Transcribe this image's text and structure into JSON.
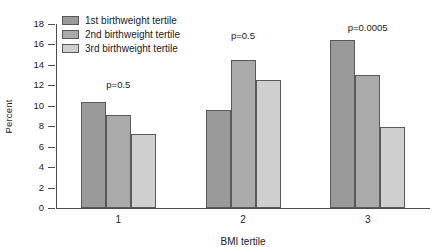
{
  "chart_data": {
    "type": "bar",
    "title": "",
    "subtitle": "",
    "xlabel": "BMI tertile",
    "ylabel": "Percent",
    "categories": [
      "1",
      "2",
      "3"
    ],
    "ylim": [
      0,
      18
    ],
    "yticks": [
      0,
      2,
      4,
      6,
      8,
      10,
      12,
      14,
      16,
      18
    ],
    "ytick_labels": [
      "0",
      "2",
      "4",
      "6",
      "8",
      "10",
      "12",
      "14",
      "16",
      "18"
    ],
    "grid": false,
    "legend_position": "top-left-inside",
    "series": [
      {
        "name": "1st birthweight tertile",
        "color": "#9a9a9a",
        "values": [
          10.3,
          9.5,
          16.3
        ]
      },
      {
        "name": "2nd birthweight tertile",
        "color": "#aaaaaa",
        "values": [
          9.0,
          14.4,
          12.9
        ]
      },
      {
        "name": "3rd birthweight tertile",
        "color": "#cfcfcf",
        "values": [
          7.1,
          12.4,
          7.8
        ]
      }
    ],
    "annotations": [
      {
        "text": "p=0.5",
        "category": "1",
        "y": 12.0
      },
      {
        "text": "p=0.5",
        "category": "2",
        "y": 16.8
      },
      {
        "text": "p=0.0005",
        "category": "3",
        "y": 17.6
      }
    ],
    "bar_edge_color": "#595959",
    "axis_color": "#4d4d4d",
    "background_color": "#ffffff"
  }
}
